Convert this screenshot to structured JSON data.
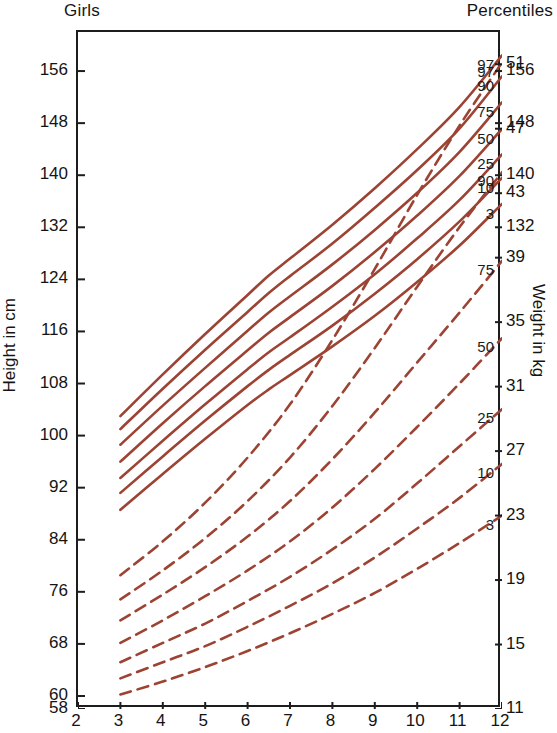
{
  "header": {
    "left_caption": "Girls",
    "right_caption": "Percentiles"
  },
  "axis_titles": {
    "left": "Height in cm",
    "right": "Weight in kg"
  },
  "chart_data": {
    "type": "line",
    "title": "Girls Percentiles",
    "subtitle": "",
    "xlabel": "",
    "ylabel": "Height in cm",
    "y2label": "Weight in kg",
    "grid": false,
    "legend_position": "right-inline-labels",
    "x": [
      2,
      3,
      4,
      5,
      6,
      7,
      8,
      9,
      10,
      11,
      12
    ],
    "xlim": [
      2,
      12
    ],
    "xticks": [
      "2",
      "3",
      "4",
      "5",
      "6",
      "7",
      "8",
      "9",
      "10",
      "11",
      "12"
    ],
    "ylim_height": [
      58,
      162
    ],
    "yticks_height": [
      "58",
      "60",
      "68",
      "76",
      "84",
      "92",
      "100",
      "108",
      "116",
      "124",
      "132",
      "140",
      "148",
      "156"
    ],
    "ylim_weight": [
      11,
      53
    ],
    "yticks_weight": [
      "11",
      "15",
      "19",
      "23",
      "27",
      "31",
      "35",
      "39",
      "43",
      "47",
      "51"
    ],
    "percentile_labels": [
      "97",
      "90",
      "75",
      "50",
      "25",
      "10",
      "3"
    ],
    "curve_color": "#9c4334",
    "height_series": [
      {
        "name": "97",
        "linestyle": "solid",
        "x": [
          3,
          4,
          5,
          6,
          6.5,
          7,
          8,
          9,
          10,
          11,
          12
        ],
        "values": [
          103.0,
          109.4,
          115.6,
          121.6,
          124.6,
          127.2,
          132.4,
          138.0,
          144.0,
          150.5,
          158.4
        ]
      },
      {
        "name": "90",
        "linestyle": "solid",
        "x": [
          3,
          4,
          5,
          6,
          6.5,
          7,
          8,
          9,
          10,
          11,
          12
        ],
        "values": [
          101.0,
          107.2,
          113.2,
          119.0,
          121.9,
          124.5,
          129.5,
          135.0,
          140.8,
          147.2,
          155.2
        ]
      },
      {
        "name": "75",
        "linestyle": "solid",
        "x": [
          3,
          4,
          5,
          6,
          6.5,
          7,
          8,
          9,
          10,
          11,
          12
        ],
        "values": [
          98.6,
          104.6,
          110.4,
          116.1,
          118.9,
          121.4,
          126.3,
          131.6,
          137.3,
          143.6,
          151.2
        ]
      },
      {
        "name": "50",
        "linestyle": "solid",
        "x": [
          3,
          4,
          5,
          6,
          6.5,
          7,
          8,
          9,
          10,
          11,
          12
        ],
        "values": [
          96.0,
          101.9,
          107.6,
          113.1,
          115.8,
          118.2,
          123.0,
          128.2,
          133.8,
          139.9,
          147.1
        ]
      },
      {
        "name": "25",
        "linestyle": "solid",
        "x": [
          3,
          4,
          5,
          6,
          6.5,
          7,
          8,
          9,
          10,
          11,
          12
        ],
        "values": [
          93.5,
          99.2,
          104.8,
          110.2,
          112.8,
          115.1,
          119.8,
          124.8,
          130.3,
          136.2,
          143.2
        ]
      },
      {
        "name": "10",
        "linestyle": "solid",
        "x": [
          3,
          4,
          5,
          6,
          6.5,
          7,
          8,
          9,
          10,
          11,
          12
        ],
        "values": [
          91.2,
          96.8,
          102.3,
          107.6,
          110.1,
          112.4,
          116.9,
          121.8,
          127.1,
          132.9,
          139.6
        ]
      },
      {
        "name": "3",
        "linestyle": "solid",
        "x": [
          3,
          4,
          5,
          6,
          6.5,
          7,
          8,
          9,
          10,
          11,
          12
        ],
        "values": [
          88.6,
          94.1,
          99.5,
          104.7,
          107.1,
          109.3,
          113.7,
          118.4,
          123.6,
          129.2,
          135.6
        ]
      }
    ],
    "weight_series": [
      {
        "name": "97",
        "linestyle": "dashed",
        "x": [
          3,
          4,
          5,
          6,
          7,
          8,
          9,
          10,
          11,
          12
        ],
        "values": [
          19.3,
          21.4,
          23.8,
          26.6,
          29.9,
          33.9,
          38.3,
          42.9,
          47.2,
          51.1
        ]
      },
      {
        "name": "90",
        "linestyle": "dashed",
        "x": [
          3,
          4,
          5,
          6,
          7,
          8,
          9,
          10,
          11,
          12
        ],
        "values": [
          17.8,
          19.6,
          21.6,
          23.9,
          26.6,
          29.8,
          33.4,
          37.2,
          40.9,
          44.3
        ]
      },
      {
        "name": "75",
        "linestyle": "dashed",
        "x": [
          3,
          4,
          5,
          6,
          7,
          8,
          9,
          10,
          11,
          12
        ],
        "values": [
          16.5,
          18.1,
          19.8,
          21.7,
          23.9,
          26.5,
          29.4,
          32.5,
          35.6,
          38.8
        ]
      },
      {
        "name": "50",
        "linestyle": "dashed",
        "x": [
          3,
          4,
          5,
          6,
          7,
          8,
          9,
          10,
          11,
          12
        ],
        "values": [
          15.1,
          16.5,
          18.0,
          19.6,
          21.4,
          23.5,
          25.9,
          28.5,
          31.2,
          34.0
        ]
      },
      {
        "name": "25",
        "linestyle": "dashed",
        "x": [
          3,
          4,
          5,
          6,
          7,
          8,
          9,
          10,
          11,
          12
        ],
        "values": [
          13.9,
          15.1,
          16.3,
          17.7,
          19.2,
          20.9,
          22.8,
          25.0,
          27.3,
          29.6
        ]
      },
      {
        "name": "10",
        "linestyle": "dashed",
        "x": [
          3,
          4,
          5,
          6,
          7,
          8,
          9,
          10,
          11,
          12
        ],
        "values": [
          12.9,
          13.9,
          14.9,
          16.1,
          17.4,
          18.8,
          20.4,
          22.2,
          24.1,
          26.2
        ]
      },
      {
        "name": "3",
        "linestyle": "dashed",
        "x": [
          3,
          4,
          5,
          6,
          7,
          8,
          9,
          10,
          11,
          12
        ],
        "values": [
          11.9,
          12.7,
          13.6,
          14.6,
          15.7,
          16.9,
          18.2,
          19.7,
          21.3,
          23.0
        ]
      }
    ]
  }
}
